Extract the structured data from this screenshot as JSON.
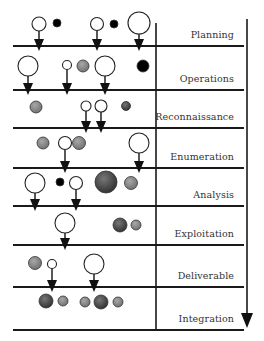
{
  "diagram": {
    "type": "phase-flow",
    "direction": "top-to-bottom",
    "phases": [
      {
        "label": "Planning",
        "line_y": 46
      },
      {
        "label": "Operations",
        "line_y": 90
      },
      {
        "label": "Reconnaissance",
        "line_y": 128
      },
      {
        "label": "Enumeration",
        "line_y": 168
      },
      {
        "label": "Analysis",
        "line_y": 206
      },
      {
        "label": "Exploitation",
        "line_y": 245
      },
      {
        "label": "Deliverable",
        "line_y": 287
      },
      {
        "label": "Integration",
        "line_y": 330
      }
    ],
    "nodes": [
      {
        "phase": 0,
        "cx": 39,
        "cy": 24,
        "r": 7,
        "fill": "#ffffff",
        "arrow": true
      },
      {
        "phase": 0,
        "cx": 57,
        "cy": 23,
        "r": 4,
        "fill": "#000000",
        "arrow": false
      },
      {
        "phase": 0,
        "cx": 97,
        "cy": 24,
        "r": 6.5,
        "fill": "#ffffff",
        "arrow": true
      },
      {
        "phase": 0,
        "cx": 114,
        "cy": 24,
        "r": 4,
        "fill": "#000000",
        "arrow": false
      },
      {
        "phase": 0,
        "cx": 139,
        "cy": 23,
        "r": 11,
        "fill": "#ffffff",
        "arrow": true
      },
      {
        "phase": 1,
        "cx": 28,
        "cy": 66,
        "r": 10,
        "fill": "#ffffff",
        "arrow": true
      },
      {
        "phase": 1,
        "cx": 67,
        "cy": 65,
        "r": 4.5,
        "fill": "#ffffff",
        "arrow": true
      },
      {
        "phase": 1,
        "cx": 83,
        "cy": 66,
        "r": 6,
        "fill": "#8a8a8a",
        "arrow": false
      },
      {
        "phase": 1,
        "cx": 105,
        "cy": 66,
        "r": 10,
        "fill": "#ffffff",
        "arrow": true
      },
      {
        "phase": 1,
        "cx": 143,
        "cy": 66,
        "r": 6,
        "fill": "#000000",
        "arrow": false
      },
      {
        "phase": 2,
        "cx": 36,
        "cy": 107,
        "r": 6,
        "fill": "#8a8a8a",
        "arrow": false
      },
      {
        "phase": 2,
        "cx": 86,
        "cy": 106,
        "r": 5,
        "fill": "#ffffff",
        "arrow": true
      },
      {
        "phase": 2,
        "cx": 101,
        "cy": 106,
        "r": 6,
        "fill": "#ffffff",
        "arrow": true
      },
      {
        "phase": 2,
        "cx": 126,
        "cy": 106,
        "r": 4.5,
        "fill": "#4a4a4a",
        "arrow": false
      },
      {
        "phase": 3,
        "cx": 43,
        "cy": 143,
        "r": 6,
        "fill": "#8a8a8a",
        "arrow": false
      },
      {
        "phase": 3,
        "cx": 65,
        "cy": 143,
        "r": 6.5,
        "fill": "#ffffff",
        "arrow": true
      },
      {
        "phase": 3,
        "cx": 79,
        "cy": 143,
        "r": 6.5,
        "fill": "#8a8a8a",
        "arrow": false
      },
      {
        "phase": 3,
        "cx": 139,
        "cy": 143,
        "r": 10,
        "fill": "#ffffff",
        "arrow": true
      },
      {
        "phase": 4,
        "cx": 35,
        "cy": 183,
        "r": 10,
        "fill": "#ffffff",
        "arrow": true
      },
      {
        "phase": 4,
        "cx": 60,
        "cy": 182,
        "r": 4,
        "fill": "#000000",
        "arrow": false
      },
      {
        "phase": 4,
        "cx": 76,
        "cy": 183,
        "r": 6.5,
        "fill": "#ffffff",
        "arrow": true
      },
      {
        "phase": 4,
        "cx": 106,
        "cy": 182,
        "r": 11,
        "fill": "#4d4d4d",
        "arrow": false
      },
      {
        "phase": 4,
        "cx": 131,
        "cy": 183,
        "r": 6.5,
        "fill": "#8a8a8a",
        "arrow": false
      },
      {
        "phase": 5,
        "cx": 65,
        "cy": 223,
        "r": 10,
        "fill": "#ffffff",
        "arrow": true
      },
      {
        "phase": 5,
        "cx": 120,
        "cy": 225,
        "r": 7,
        "fill": "#4d4d4d",
        "arrow": false
      },
      {
        "phase": 5,
        "cx": 136,
        "cy": 225,
        "r": 5,
        "fill": "#8a8a8a",
        "arrow": false
      },
      {
        "phase": 6,
        "cx": 35,
        "cy": 263,
        "r": 6.5,
        "fill": "#8a8a8a",
        "arrow": false
      },
      {
        "phase": 6,
        "cx": 52,
        "cy": 264,
        "r": 4.5,
        "fill": "#ffffff",
        "arrow": true
      },
      {
        "phase": 6,
        "cx": 94,
        "cy": 264,
        "r": 10,
        "fill": "#ffffff",
        "arrow": true
      },
      {
        "phase": 7,
        "cx": 46,
        "cy": 301,
        "r": 7,
        "fill": "#4d4d4d",
        "arrow": false
      },
      {
        "phase": 7,
        "cx": 63,
        "cy": 301,
        "r": 5,
        "fill": "#8a8a8a",
        "arrow": false
      },
      {
        "phase": 7,
        "cx": 85,
        "cy": 302,
        "r": 5,
        "fill": "#8a8a8a",
        "arrow": false
      },
      {
        "phase": 7,
        "cx": 101,
        "cy": 302,
        "r": 7,
        "fill": "#4d4d4d",
        "arrow": false
      },
      {
        "phase": 7,
        "cx": 118,
        "cy": 302,
        "r": 5,
        "fill": "#8a8a8a",
        "arrow": false
      }
    ],
    "colors": {
      "line": "#1a1a1a",
      "open": "#ffffff",
      "black": "#000000",
      "gray": "#8a8a8a",
      "dark_gray": "#4d4d4d"
    }
  }
}
